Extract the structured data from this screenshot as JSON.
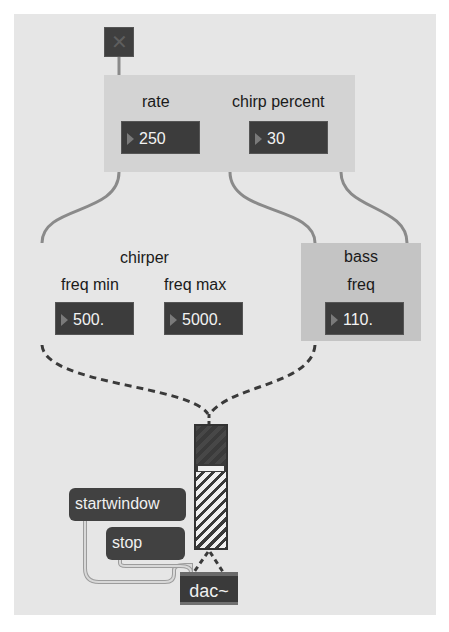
{
  "patch": {
    "toggle": {
      "state": "off",
      "icon": "x-mark-icon"
    },
    "top_panel": {
      "rate_label": "rate",
      "rate_value": "250",
      "chirp_label": "chirp percent",
      "chirp_value": "30"
    },
    "chirper_panel": {
      "title": "chirper",
      "freq_min_label": "freq min",
      "freq_min_value": "500.",
      "freq_max_label": "freq max",
      "freq_max_value": "5000."
    },
    "bass_panel": {
      "title": "bass",
      "freq_label": "freq",
      "freq_value": "110."
    },
    "messages": {
      "startwindow": "startwindow",
      "stop": "stop"
    },
    "dac": {
      "label": "dac~"
    },
    "colors": {
      "canvas": "#e6e6e6",
      "panel_top": "#d3d3d3",
      "panel_bass": "#c4c4c4",
      "object_dark": "#3c3c3c",
      "cable_control": "#8a8a8a",
      "cable_signal": "#3a3a3a"
    }
  }
}
